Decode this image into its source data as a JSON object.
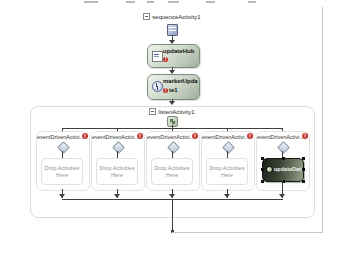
{
  "sequence": {
    "label": "sequenceActivity1"
  },
  "activity1": {
    "name": "updateHub"
  },
  "activity2": {
    "name_line1": "marketUpda",
    "name_line2": "te1"
  },
  "listen": {
    "label": "listenActivity1"
  },
  "branches": [
    {
      "label": "eventDrivenActivi...",
      "drop_text": "Drop Activities Here"
    },
    {
      "label": "eventDrivenActivi...",
      "drop_text": "Drop Activities Here"
    },
    {
      "label": "eventDrivenActivi...",
      "drop_text": "Drop Activities Here"
    },
    {
      "label": "eventDrivenActivi...",
      "drop_text": "Drop Activities Here"
    },
    {
      "label": "eventDrivenActivi...",
      "selected_activity": "updateData"
    }
  ],
  "icons": {
    "error_glyph": "!"
  },
  "colors": {
    "activity_border": "#7e8e7c",
    "activity_fill_light": "#eef2ec",
    "activity_fill_dark": "#a3b09e",
    "selected_fill_dark": "#1d221a",
    "selected_fill_light": "#96a189",
    "error_red": "#c03028",
    "connector": "#3f3f3f",
    "container_border": "#dcdcdc",
    "loop_connector": "#c6c6c6"
  }
}
